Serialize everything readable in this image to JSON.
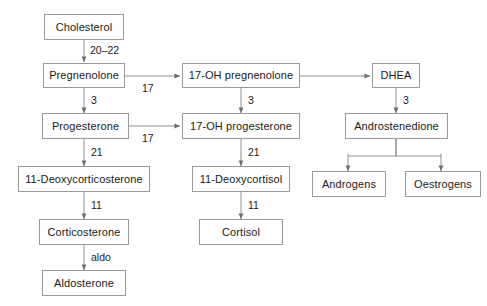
{
  "diagram": {
    "background_color": "#ffffff",
    "box_border_color": "#9a9a9a",
    "line_color": "#8f8f8f",
    "text_color": "#1a1a1a",
    "nodes": [
      {
        "id": "cholesterol",
        "label": "Cholesterol"
      },
      {
        "id": "pregnenolone",
        "label": "Pregnenolone"
      },
      {
        "id": "progesterone",
        "label": "Progesterone"
      },
      {
        "id": "deoxycorticosterone",
        "label": "11-Deoxycorticosterone"
      },
      {
        "id": "corticosterone",
        "label": "Corticosterone"
      },
      {
        "id": "aldosterone",
        "label": "Aldosterone"
      },
      {
        "id": "oh_pregnenolone",
        "label": "17-OH pregnenolone"
      },
      {
        "id": "oh_progesterone",
        "label": "17-OH progesterone"
      },
      {
        "id": "deoxycortisol",
        "label": "11-Deoxycortisol"
      },
      {
        "id": "cortisol",
        "label": "Cortisol"
      },
      {
        "id": "dhea",
        "label": "DHEA"
      },
      {
        "id": "androstenedione",
        "label": "Androstenedione"
      },
      {
        "id": "androgens",
        "label": "Androgens"
      },
      {
        "id": "oestrogens",
        "label": "Oestrogens"
      }
    ],
    "edge_labels": [
      {
        "id": "chol_to_preg",
        "label": "20–22"
      },
      {
        "id": "preg_to_prog",
        "label": "3"
      },
      {
        "id": "prog_to_doc",
        "label": "21"
      },
      {
        "id": "doc_to_cortico",
        "label": "11"
      },
      {
        "id": "cortico_to_aldo",
        "label": "aldo"
      },
      {
        "id": "preg_to_ohpreg",
        "label": "17"
      },
      {
        "id": "prog_to_ohprog",
        "label": "17"
      },
      {
        "id": "ohpreg_to_ohprog",
        "label": "3"
      },
      {
        "id": "ohprog_to_dcort",
        "label": "21"
      },
      {
        "id": "dcort_to_cortisol",
        "label": "11"
      },
      {
        "id": "dhea_to_andro",
        "label": "3"
      }
    ]
  }
}
